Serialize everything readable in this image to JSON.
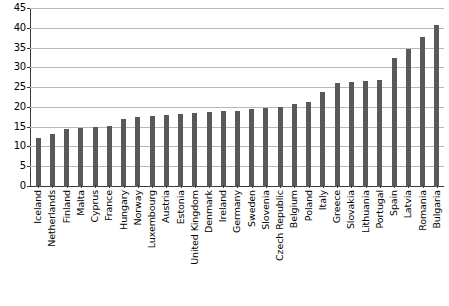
{
  "chart_data": {
    "type": "bar",
    "title": "",
    "subtitle": "",
    "xlabel": "",
    "ylabel": "",
    "ylim": [
      0,
      45
    ],
    "ytick_step": 5,
    "yticks": [
      0,
      5,
      10,
      15,
      20,
      25,
      30,
      35,
      40,
      45
    ],
    "grid": true,
    "legend": false,
    "legend_position": "none",
    "bar_color": "#595959",
    "gridline_color": "#b8b8b8",
    "axis_color": "#3a3a3a",
    "categories": [
      "Iceland",
      "Netherlands",
      "Finland",
      "Malta",
      "Cyprus",
      "France",
      "Hungary",
      "Norway",
      "Luxembourg",
      "Austria",
      "Estonia",
      "United Kingdom",
      "Denmark",
      "Ireland",
      "Germany",
      "Sweden",
      "Slovenia",
      "Czech Republic",
      "Belgium",
      "Poland",
      "Italy",
      "Greece",
      "Slovakia",
      "Lithuania",
      "Portugal",
      "Spain",
      "Latvia",
      "Romania",
      "Bulgaria"
    ],
    "values": [
      12.3,
      13.4,
      14.6,
      15.0,
      15.2,
      15.3,
      17.2,
      17.8,
      18.0,
      18.1,
      18.4,
      18.6,
      19.0,
      19.1,
      19.3,
      19.6,
      20.0,
      20.3,
      21.0,
      21.4,
      24.0,
      26.4,
      26.6,
      26.7,
      27.0,
      32.5,
      34.9,
      37.9,
      41.0
    ]
  }
}
